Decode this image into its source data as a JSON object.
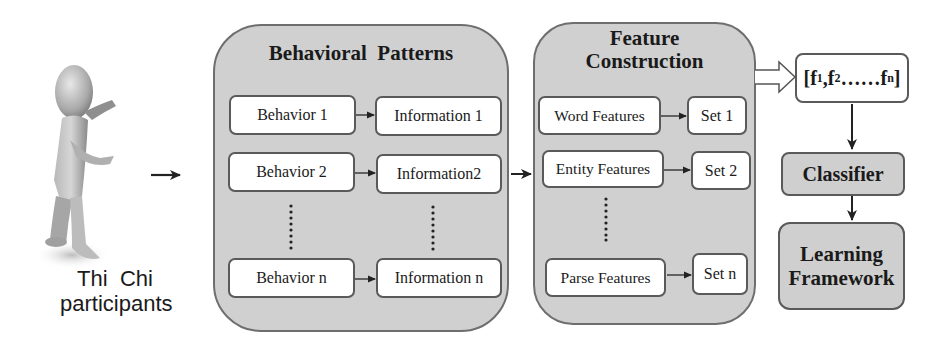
{
  "figure": {
    "participant": {
      "label_line1": "Thi  Chi",
      "label_line2": "participants",
      "icon": "3d-person-figure"
    },
    "behavioral_patterns": {
      "title": "Behavioral  Patterns",
      "rows": [
        {
          "behavior": "Behavior 1",
          "information": "Information 1"
        },
        {
          "behavior": "Behavior 2",
          "information": "Information2"
        },
        {
          "behavior": "Behavior n",
          "information": "Information n"
        }
      ],
      "ellipsis": "vertical-dots"
    },
    "feature_construction": {
      "title_line1": "Feature",
      "title_line2": "Construction",
      "rows": [
        {
          "feature": "Word Features",
          "set": "Set 1"
        },
        {
          "feature": "Entity Features",
          "set": "Set 2"
        },
        {
          "feature": "Parse Features",
          "set": "Set n"
        }
      ],
      "ellipsis": "vertical-dots"
    },
    "feature_vector": {
      "open": "[",
      "f1": "f",
      "sub1": "1",
      "sep1": ",",
      "f2": "f",
      "sub2": "2",
      "dots": "……",
      "fn": "f",
      "subn": "n",
      "close": "]"
    },
    "classifier": {
      "label": "Classifier"
    },
    "learning_framework": {
      "label_line1": "Learning",
      "label_line2": "Framework"
    },
    "colors": {
      "panel_fill": "#d0d0d0",
      "panel_border": "#6e6e6e",
      "box_fill": "#ffffff",
      "arrow": "#222222"
    }
  }
}
